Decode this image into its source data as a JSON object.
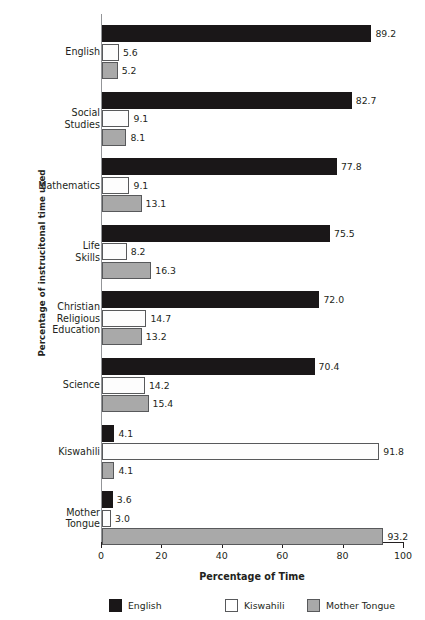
{
  "chart_data": {
    "type": "bar",
    "orientation": "horizontal",
    "title": "",
    "xlabel": "Percentage of Time",
    "ylabel": "Percentage of instrucitonal time used",
    "xlim": [
      0,
      100
    ],
    "xticks": [
      0,
      20,
      40,
      60,
      80,
      100
    ],
    "xticklabels": [
      "0",
      "20",
      "40",
      "60",
      "80",
      "100"
    ],
    "grid": false,
    "legend_position": "bottom",
    "categories": [
      "English",
      "Social Studies",
      "Mathematics",
      "Life Skills",
      "Christian Religious Education",
      "Science",
      "Kiswahili",
      "Mother Tongue"
    ],
    "category_lines": [
      [
        "English"
      ],
      [
        "Social",
        "Studies"
      ],
      [
        "Mathematics"
      ],
      [
        "Life",
        "Skills"
      ],
      [
        "Christian",
        "Religious",
        "Education"
      ],
      [
        "Science"
      ],
      [
        "Kiswahili"
      ],
      [
        "Mother",
        "Tongue"
      ]
    ],
    "series": [
      {
        "name": "English",
        "color": "#1a1718",
        "values": [
          89.2,
          82.7,
          77.8,
          75.5,
          72.0,
          70.4,
          4.1,
          3.6
        ],
        "labels": [
          "89.2",
          "82.7",
          "77.8",
          "75.5",
          "72.0",
          "70.4",
          "4.1",
          "3.6"
        ]
      },
      {
        "name": "Kiswahili",
        "color": "#fdfdfd",
        "values": [
          5.6,
          9.1,
          9.1,
          8.2,
          14.7,
          14.2,
          91.8,
          3.0
        ],
        "labels": [
          "5.6",
          "9.1",
          "9.1",
          "8.2",
          "14.7",
          "14.2",
          "91.8",
          "3.0"
        ]
      },
      {
        "name": "Mother Tongue",
        "color": "#a9a9a9",
        "values": [
          5.2,
          8.1,
          13.1,
          16.3,
          13.2,
          15.4,
          4.1,
          93.2
        ],
        "labels": [
          "5.2",
          "8.1",
          "13.1",
          "16.3",
          "13.2",
          "15.4",
          "4.1",
          "93.2"
        ]
      }
    ]
  },
  "legend": {
    "items": [
      {
        "label": "English"
      },
      {
        "label": "Kiswahili"
      },
      {
        "label": "Mother Tongue"
      }
    ]
  }
}
